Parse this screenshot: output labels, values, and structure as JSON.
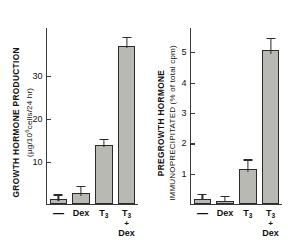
{
  "figure": {
    "background_color": "#ffffff",
    "bar_fill_color": "#b9b9b4",
    "bar_edge_color": "#2b2b2b",
    "axis_color": "#3a3a3a"
  },
  "chart_data": [
    {
      "type": "bar",
      "panel": "left",
      "title": "",
      "ylabel_line1": "GROWTH HORMONE PRODUCTION",
      "ylabel_line2": "(µg/10⁶cells/24 hr)",
      "xlabel": "",
      "categories": [
        "—",
        "Dex",
        "T₃",
        "T₃ + Dex"
      ],
      "category_labels_display": [
        "—",
        "Dex",
        "T3",
        "T3 + Dex"
      ],
      "values": [
        1.0,
        2.4,
        13.7,
        37.0
      ],
      "errors": [
        0.9,
        1.5,
        1.3,
        1.8
      ],
      "tick_labels": [
        "10",
        "20",
        "30"
      ],
      "tick_values": [
        10,
        20,
        30
      ],
      "ylim": [
        0,
        41
      ],
      "grid": false,
      "legend": "none"
    },
    {
      "type": "bar",
      "panel": "right",
      "title": "",
      "ylabel_line1": "PREGROWTH HORMONE",
      "ylabel_line2": "IMMUNOPRECIPITATED (% of total cpm)",
      "xlabel": "",
      "categories": [
        "—",
        "Dex",
        "T₃",
        "T₃ + Dex"
      ],
      "category_labels_display": [
        "—",
        "Dex",
        "T3",
        "T3 + Dex"
      ],
      "values": [
        0.16,
        0.1,
        1.15,
        5.05
      ],
      "errors": [
        0.13,
        0.12,
        0.27,
        0.35
      ],
      "tick_labels": [
        "1",
        "2",
        "3",
        "4",
        "5"
      ],
      "tick_values": [
        1,
        2,
        3,
        4,
        5
      ],
      "ylim": [
        0,
        5.75
      ],
      "grid": false,
      "legend": "none"
    }
  ],
  "left_panel": {
    "axis_title_line1": "GROWTH HORMONE PRODUCTION",
    "axis_title_line2_pre": "(µg/10",
    "axis_title_line2_sup": "6",
    "axis_title_line2_post": "cells/24 hr)",
    "ticks": [
      {
        "label": "10",
        "value": 10
      },
      {
        "label": "20",
        "value": 20
      },
      {
        "label": "30",
        "value": 30
      }
    ],
    "bars": [
      {
        "name": "control",
        "label": "—",
        "label_sub": "",
        "value": 1.0,
        "error": 0.9
      },
      {
        "name": "dex",
        "label": "Dex",
        "label_sub": "",
        "value": 2.4,
        "error": 1.5
      },
      {
        "name": "t3",
        "label": "T",
        "label_sub": "3",
        "value": 13.7,
        "error": 1.3
      },
      {
        "name": "t3-dex",
        "label": "T",
        "label_sub": "3",
        "value": 37.0,
        "error": 1.8,
        "label_plus": "+",
        "label_line3": "Dex"
      }
    ]
  },
  "right_panel": {
    "axis_title_line1": "PREGROWTH HORMONE",
    "axis_title_line2": "IMMUNOPRECIPITATED (% of total cpm)",
    "ticks": [
      {
        "label": "1",
        "value": 1
      },
      {
        "label": "2",
        "value": 2
      },
      {
        "label": "3",
        "value": 3
      },
      {
        "label": "4",
        "value": 4
      },
      {
        "label": "5",
        "value": 5
      }
    ],
    "bars": [
      {
        "name": "control",
        "label": "—",
        "label_sub": "",
        "value": 0.16,
        "error": 0.13
      },
      {
        "name": "dex",
        "label": "Dex",
        "label_sub": "",
        "value": 0.1,
        "error": 0.12
      },
      {
        "name": "t3",
        "label": "T",
        "label_sub": "3",
        "value": 1.15,
        "error": 0.27
      },
      {
        "name": "t3-dex",
        "label": "T",
        "label_sub": "3",
        "value": 5.05,
        "error": 0.35,
        "label_plus": "+",
        "label_line3": "Dex"
      }
    ]
  }
}
